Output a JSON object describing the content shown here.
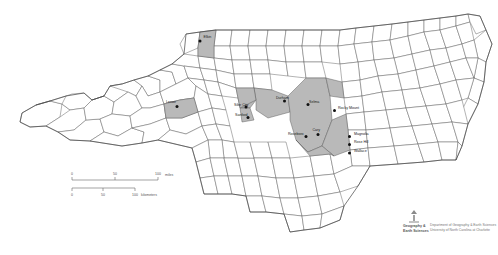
{
  "map": {
    "title": "North Carolina Counties",
    "subject_state": "North Carolina",
    "background_color": "#ffffff",
    "county_fill_color": "#ffffff",
    "county_stroke_color": "#555555",
    "highlight_fill_color": "#b9b9b9",
    "city_dot_color": "#111111",
    "label_text_color": "#1a1a1a"
  },
  "cities": [
    {
      "name": "Elkin",
      "label_x": 203.5,
      "label_y": 38.0,
      "dot_x": 200.0,
      "dot_y": 41.0,
      "anchor": "start"
    },
    {
      "name": "Lenoir",
      "label_x": 166.0,
      "label_y": 103.0,
      "dot_x": 177.0,
      "dot_y": 106.5,
      "anchor": "start"
    },
    {
      "name": "Siler City",
      "label_x": 234.0,
      "label_y": 105.5,
      "dot_x": 246.0,
      "dot_y": 107.0,
      "anchor": "start"
    },
    {
      "name": "Sanford",
      "label_x": 235.0,
      "label_y": 116.0,
      "dot_x": 248.0,
      "dot_y": 117.5,
      "anchor": "start"
    },
    {
      "name": "Durham",
      "label_x": 276.0,
      "label_y": 99.0,
      "dot_x": 284.5,
      "dot_y": 101.0,
      "anchor": "start"
    },
    {
      "name": "Selma",
      "label_x": 309.0,
      "label_y": 103.0,
      "dot_x": 308.0,
      "dot_y": 104.5,
      "anchor": "start"
    },
    {
      "name": "Rocky Mount",
      "label_x": 338.0,
      "label_y": 109.0,
      "dot_x": 334.5,
      "dot_y": 110.5,
      "anchor": "start"
    },
    {
      "name": "Cary",
      "label_x": 312.5,
      "label_y": 131.0,
      "dot_x": 318.0,
      "dot_y": 134.5,
      "anchor": "start"
    },
    {
      "name": "Roseboro",
      "label_x": 288.0,
      "label_y": 134.5,
      "dot_x": 306.0,
      "dot_y": 136.5,
      "anchor": "start"
    },
    {
      "name": "Magnolia",
      "label_x": 354.0,
      "label_y": 135.0,
      "dot_x": 349.5,
      "dot_y": 136.5,
      "anchor": "start"
    },
    {
      "name": "Rose Hill",
      "label_x": 354.0,
      "label_y": 143.0,
      "dot_x": 349.5,
      "dot_y": 144.5,
      "anchor": "start"
    },
    {
      "name": "Wallace",
      "label_x": 354.0,
      "label_y": 151.5,
      "dot_x": 349.5,
      "dot_y": 153.0,
      "anchor": "start"
    }
  ],
  "scale_bar": {
    "miles": {
      "unit_label": "miles",
      "ticks": [
        "0",
        "50",
        "100"
      ]
    },
    "kilometers": {
      "unit_label": "kilometers",
      "ticks": [
        "0",
        "50",
        "100"
      ]
    }
  },
  "credit": {
    "logo_line_1": "Geography &",
    "logo_line_2": "Earth Sciences",
    "line_1": "Department of Geography & Earth Sciences",
    "line_2": "University of North Carolina at Charlotte"
  }
}
